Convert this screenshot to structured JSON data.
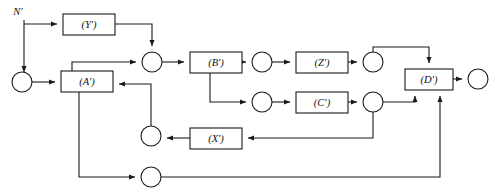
{
  "diagram": {
    "type": "signal-flow-block-diagram",
    "stroke_color": "#1a1a1a",
    "background_color": "#ffffff",
    "external_labels": [
      {
        "id": "input-N",
        "text": "N′",
        "x": 18,
        "y": 13
      }
    ],
    "blocks": [
      {
        "id": "block-Y",
        "label": "(Y′)",
        "x": 63,
        "y": 14,
        "w": 52,
        "h": 21
      },
      {
        "id": "block-A",
        "label": "(A′)",
        "x": 61,
        "y": 71,
        "w": 52,
        "h": 21
      },
      {
        "id": "block-B",
        "label": "(B′)",
        "x": 190,
        "y": 52,
        "w": 52,
        "h": 21
      },
      {
        "id": "block-Z",
        "label": "(Z′)",
        "x": 296,
        "y": 52,
        "w": 52,
        "h": 21
      },
      {
        "id": "block-C",
        "label": "(C′)",
        "x": 296,
        "y": 92,
        "w": 52,
        "h": 21
      },
      {
        "id": "block-X",
        "label": "(X′)",
        "x": 190,
        "y": 128,
        "w": 52,
        "h": 21
      },
      {
        "id": "block-D",
        "label": "(D′)",
        "x": 405,
        "y": 69,
        "w": 48,
        "h": 21
      }
    ],
    "nodes": [
      {
        "id": "node-input",
        "x": 22,
        "y": 82,
        "r": 10
      },
      {
        "id": "node-sum-top",
        "x": 152,
        "y": 62,
        "r": 10
      },
      {
        "id": "node-after-B",
        "x": 262,
        "y": 62,
        "r": 10
      },
      {
        "id": "node-after-Z",
        "x": 373,
        "y": 62,
        "r": 10
      },
      {
        "id": "node-pre-C",
        "x": 262,
        "y": 102,
        "r": 10
      },
      {
        "id": "node-after-C",
        "x": 373,
        "y": 102,
        "r": 10
      },
      {
        "id": "node-pre-X-left",
        "x": 151,
        "y": 136,
        "r": 10
      },
      {
        "id": "node-bottom",
        "x": 151,
        "y": 177,
        "r": 10
      },
      {
        "id": "node-output",
        "x": 478,
        "y": 79,
        "r": 10
      }
    ],
    "edges": [
      {
        "id": "edge-N-to-Y",
        "from": "input-N",
        "to": "block-Y",
        "arrow": true
      },
      {
        "id": "edge-N-to-input",
        "from": "input-N",
        "to": "node-input",
        "arrow": true
      },
      {
        "id": "edge-Y-to-sum",
        "from": "block-Y",
        "to": "node-sum-top",
        "arrow": true
      },
      {
        "id": "edge-input-to-A",
        "from": "node-input",
        "to": "block-A",
        "arrow": true
      },
      {
        "id": "edge-A-to-sum",
        "from": "block-A",
        "to": "node-sum-top",
        "arrow": true
      },
      {
        "id": "edge-sum-to-B",
        "from": "node-sum-top",
        "to": "block-B",
        "arrow": true
      },
      {
        "id": "edge-B-to-afterB",
        "from": "block-B",
        "to": "node-after-B",
        "arrow": true
      },
      {
        "id": "edge-B-to-preC",
        "from": "block-B",
        "to": "node-pre-C",
        "arrow": true
      },
      {
        "id": "edge-afterB-to-Z",
        "from": "node-after-B",
        "to": "block-Z",
        "arrow": true
      },
      {
        "id": "edge-Z-to-afterZ",
        "from": "block-Z",
        "to": "node-after-Z",
        "arrow": true
      },
      {
        "id": "edge-afterZ-to-D",
        "from": "node-after-Z",
        "to": "block-D",
        "arrow": true
      },
      {
        "id": "edge-preC-to-C",
        "from": "node-pre-C",
        "to": "block-C",
        "arrow": true
      },
      {
        "id": "edge-C-to-afterC",
        "from": "block-C",
        "to": "node-after-C",
        "arrow": true
      },
      {
        "id": "edge-afterC-to-D",
        "from": "node-after-C",
        "to": "block-D",
        "arrow": true
      },
      {
        "id": "edge-afterC-to-X",
        "from": "node-after-C",
        "to": "block-X",
        "arrow": true
      },
      {
        "id": "edge-X-to-preX",
        "from": "block-X",
        "to": "node-pre-X-left",
        "arrow": true
      },
      {
        "id": "edge-preX-to-A",
        "from": "node-pre-X-left",
        "to": "block-A",
        "arrow": true
      },
      {
        "id": "edge-A-to-bottom",
        "from": "block-A",
        "to": "node-bottom",
        "arrow": true
      },
      {
        "id": "edge-bottom-to-D",
        "from": "node-bottom",
        "to": "block-D",
        "arrow": true
      },
      {
        "id": "edge-D-to-output",
        "from": "block-D",
        "to": "node-output",
        "arrow": true
      }
    ]
  }
}
